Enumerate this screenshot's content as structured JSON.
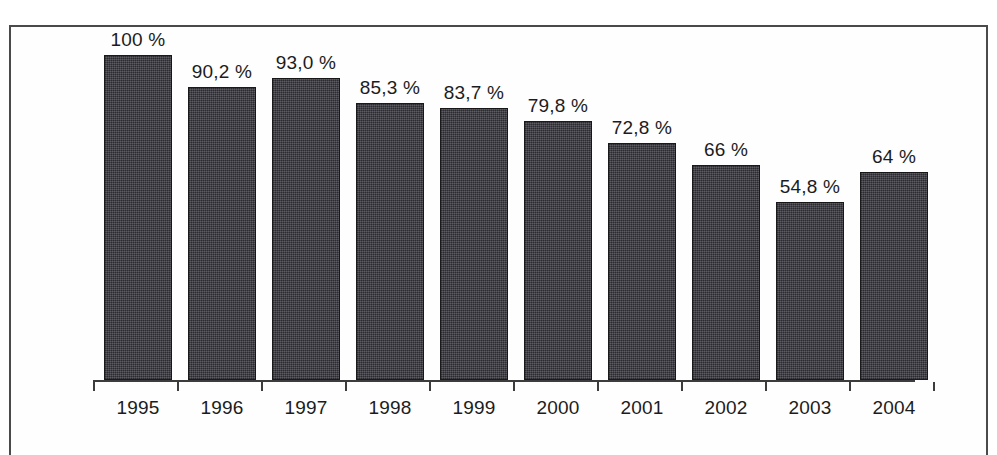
{
  "chart_data": {
    "type": "bar",
    "title": "",
    "subtitle": "",
    "xlabel": "",
    "ylabel": "",
    "categories": [
      "1995",
      "1996",
      "1997",
      "1998",
      "1999",
      "2000",
      "2001",
      "2002",
      "2003",
      "2004"
    ],
    "values": [
      100,
      90.2,
      93.0,
      85.3,
      83.7,
      79.8,
      72.8,
      66,
      54.8,
      64
    ],
    "value_labels": [
      "100 %",
      "90,2 %",
      "93,0 %",
      "85,3 %",
      "83,7 %",
      "79,8 %",
      "72,8 %",
      "66 %",
      "54,8 %",
      "64 %"
    ],
    "ylim": [
      0,
      100
    ],
    "grid": false,
    "legend": null,
    "legend_position": "none",
    "series": [
      {
        "name": "",
        "values": [
          100,
          90.2,
          93.0,
          85.3,
          83.7,
          79.8,
          72.8,
          66,
          54.8,
          64
        ]
      }
    ],
    "colors": {
      "bar_fill": "#33333a",
      "axis": "#3c3c3c",
      "text": "#1c1c1c",
      "frame_border": "#4a4a4a",
      "background": "#fefefe"
    }
  },
  "axis": {
    "tick_count": 11,
    "baseline_visible": true
  }
}
